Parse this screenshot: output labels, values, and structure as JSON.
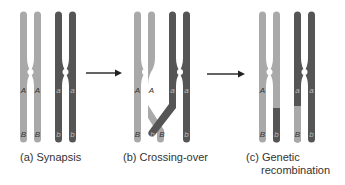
{
  "colors": {
    "light_chromosome": "#a9a9a9",
    "dark_chromosome": "#555555",
    "arrow": "#222222",
    "caption_text": "#333333"
  },
  "panels": [
    {
      "id": "a",
      "caption": "(a) Synapsis",
      "chromatids": [
        {
          "color": "light",
          "upper_label": "A",
          "lower_label": "B"
        },
        {
          "color": "light",
          "upper_label": "A",
          "lower_label": "B"
        },
        {
          "color": "dark",
          "upper_label": "a",
          "lower_label": "b"
        },
        {
          "color": "dark",
          "upper_label": "a",
          "lower_label": "b"
        }
      ]
    },
    {
      "id": "b",
      "caption": "(b) Crossing-over",
      "chromatids": [
        {
          "color": "light",
          "upper_label": "A",
          "lower_label": "B"
        },
        {
          "color": "light",
          "upper_label": "A",
          "lower_label": "B",
          "crossed": true
        },
        {
          "color": "dark",
          "upper_label": "a",
          "lower_label": "b",
          "crossed": true
        },
        {
          "color": "dark",
          "upper_label": "a",
          "lower_label": "b"
        }
      ]
    },
    {
      "id": "c",
      "caption_line1": "(c) Genetic",
      "caption_line2": "recombination",
      "chromatids": [
        {
          "color": "light",
          "upper_label": "A",
          "lower_label": "B"
        },
        {
          "color": "light/dark",
          "upper_label": "A",
          "lower_label": "b"
        },
        {
          "color": "dark/light",
          "upper_label": "a",
          "lower_label": "B"
        },
        {
          "color": "dark",
          "upper_label": "a",
          "lower_label": "b"
        }
      ]
    }
  ],
  "arrows": [
    {
      "from": "a",
      "to": "b"
    },
    {
      "from": "b",
      "to": "c"
    }
  ]
}
